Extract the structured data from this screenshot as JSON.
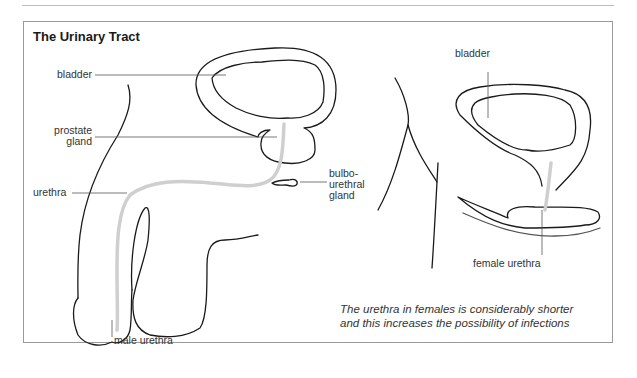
{
  "figure": {
    "title": "The Urinary Tract",
    "male_labels": {
      "bladder": "bladder",
      "prostate_1": "prostate",
      "prostate_2": "gland",
      "urethra": "urethra",
      "bulbo_1": "bulbo-",
      "bulbo_2": "urethral",
      "bulbo_3": "gland",
      "male_urethra": "male urethra"
    },
    "female_labels": {
      "bladder": "bladder",
      "female_urethra": "female urethra"
    },
    "caption_line1": "The urethra in females is considerably shorter",
    "caption_line2": "and this increases the possibility of infections",
    "colors": {
      "outline": "#1a1a1a",
      "urethra": "#cfcfcf",
      "frame": "#9a9a9a",
      "leader": "#555555"
    }
  }
}
